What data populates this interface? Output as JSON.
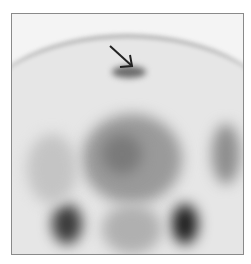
{
  "image": {
    "description": "Grayscale scintigraphy-style scan with arrow pointing to focal uptake near top",
    "annotation": {
      "type": "arrow",
      "direction": "down-right",
      "color": "#222222"
    },
    "colors": {
      "background": "#ffffff",
      "frame_border": "#8a8a8a",
      "scan_light": "#eeeeee",
      "scan_dark": "#1a1a1a"
    }
  }
}
